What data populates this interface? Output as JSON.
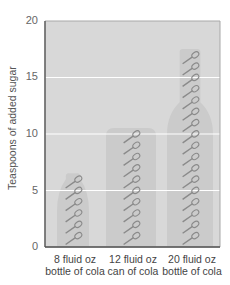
{
  "chart_data": {
    "type": "bar",
    "title": "",
    "xlabel": "",
    "ylabel": "Teaspoons of added sugar",
    "ylim": [
      0,
      20
    ],
    "yticks": [
      0,
      5,
      10,
      15,
      20
    ],
    "grid": true,
    "categories": [
      "8 fluid oz bottle of cola",
      "12 fluid oz can of cola",
      "20 fluid oz bottle of cola"
    ],
    "category_lines": [
      [
        "8 fluid oz",
        "bottle of cola"
      ],
      [
        "12 fluid oz",
        "can of cola"
      ],
      [
        "20 fluid oz",
        "bottle of cola"
      ]
    ],
    "values": [
      6,
      10,
      17
    ],
    "marker": "teaspoon-icon",
    "container_shapes": [
      "bottle",
      "can",
      "bottle"
    ],
    "colors": {
      "plot_bg": "#d8d8d8",
      "container": "#cbcbcb",
      "grid": "#ffffff",
      "spoon": "#8a8a8a",
      "axis": "#555555"
    }
  }
}
